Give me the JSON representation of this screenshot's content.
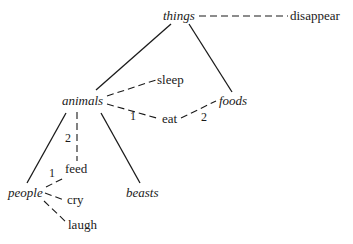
{
  "diagram": {
    "type": "semantic-tree",
    "nodes": {
      "things": "things",
      "animals": "animals",
      "foods": "foods",
      "people": "people",
      "beasts": "beasts",
      "disappear": "disappear",
      "sleep": "sleep",
      "eat": "eat",
      "feed": "feed",
      "cry": "cry",
      "laugh": "laugh"
    },
    "edge_labels": {
      "animals_eat": "1",
      "eat_foods": "2",
      "animals_feed": "2",
      "people_feed": "1"
    },
    "edges": [
      {
        "from": "things",
        "to": "animals",
        "style": "solid"
      },
      {
        "from": "things",
        "to": "foods",
        "style": "solid"
      },
      {
        "from": "animals",
        "to": "people",
        "style": "solid"
      },
      {
        "from": "animals",
        "to": "beasts",
        "style": "solid"
      },
      {
        "from": "things",
        "to": "disappear",
        "style": "dashed"
      },
      {
        "from": "animals",
        "to": "sleep",
        "style": "dashed"
      },
      {
        "from": "animals",
        "to": "eat",
        "style": "dashed",
        "label": "1"
      },
      {
        "from": "eat",
        "to": "foods",
        "style": "dashed",
        "label": "2"
      },
      {
        "from": "animals",
        "to": "feed",
        "style": "dashed",
        "label": "2"
      },
      {
        "from": "people",
        "to": "feed",
        "style": "dashed",
        "label": "1"
      },
      {
        "from": "people",
        "to": "cry",
        "style": "dashed"
      },
      {
        "from": "people",
        "to": "laugh",
        "style": "dashed"
      }
    ]
  }
}
